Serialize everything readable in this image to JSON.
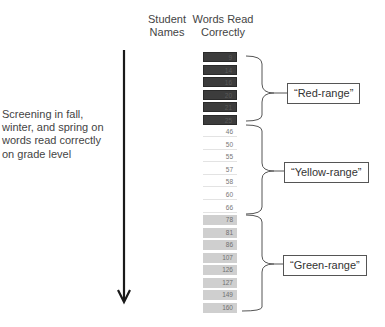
{
  "headers": {
    "student_names": "Student Names",
    "words_read_correctly": "Words Read Correctly"
  },
  "left_description": "Screening in fall, winter, and spring on words read correctly on grade level",
  "ranges": [
    {
      "name": "red",
      "label": "“Red-range”",
      "color": "#3c3c3c",
      "values": [
        "9",
        "14",
        "16",
        "20",
        "21",
        "25"
      ]
    },
    {
      "name": "yellow",
      "label": "“Yellow-range”",
      "color": "#ffffff",
      "values": [
        "46",
        "50",
        "55",
        "57",
        "58",
        "60",
        "66"
      ]
    },
    {
      "name": "green",
      "label": "“Green-range”",
      "color": "#cfcfcf",
      "values": [
        "78",
        "81",
        "86",
        "107",
        "126",
        "127",
        "149",
        "160"
      ]
    }
  ]
}
